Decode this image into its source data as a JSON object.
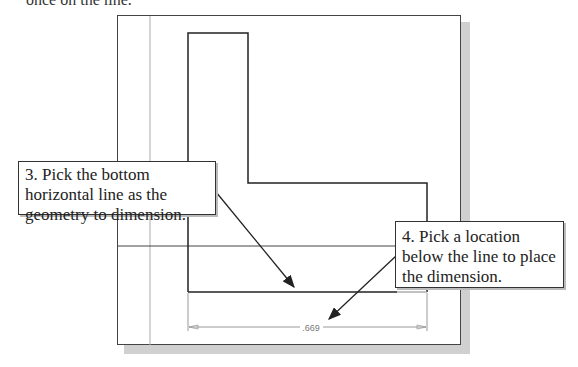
{
  "header": {
    "cut_text": "once on the line."
  },
  "callouts": [
    {
      "step": 3,
      "text": "3. Pick the bottom horizontal line as the geometry to dimension."
    },
    {
      "step": 4,
      "text": "4. Pick a location below the line to place the dimension."
    }
  ],
  "dimension": {
    "value": ".669"
  },
  "colors": {
    "line": "#222222",
    "construction": "#aaaaaa",
    "highlight": "#999999",
    "shadow": "#d0d0d0"
  }
}
